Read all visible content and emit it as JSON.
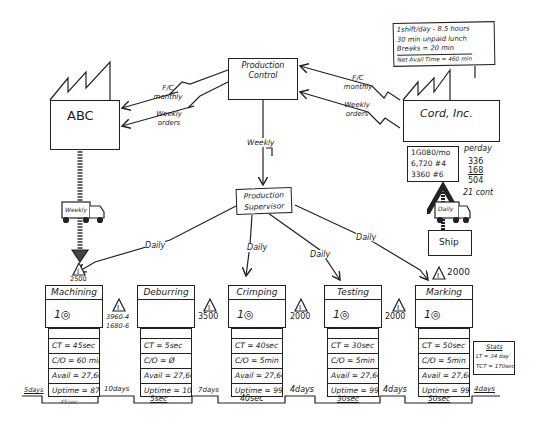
{
  "diagram": {
    "type": "value-stream-map",
    "supplier": {
      "name": "ABC",
      "fc_label": "F/C monthly",
      "orders_label": "Weekly orders",
      "delivery_truck": "Weekly"
    },
    "customer": {
      "name": "Cord, Inc.",
      "fc_label": "F/C monthly",
      "orders_label": "Weekly orders",
      "delivery_truck": "Daily",
      "shipping_box": "Ship",
      "demand_box": {
        "line1": "1G080/mo",
        "line2": "6,720 #4",
        "line3": "3360 #6"
      },
      "per_day": {
        "label": "perday",
        "v1": "336",
        "v2": "168",
        "total": "504",
        "containers": "21 cont"
      },
      "shift_note": {
        "line1": "1shift/day - 8.5 hours",
        "line2": "30 min unpaid lunch",
        "line3": "Breaks = 20 min",
        "line4": "Net Avail Time = 460 min"
      }
    },
    "control": {
      "production_control": "Production Control",
      "supervisor": "Production Supervisor",
      "weekly_label": "Weekly",
      "daily_label": "Daily"
    },
    "inventory": [
      {
        "id": "before-machining",
        "value": "2500"
      },
      {
        "id": "machining-deburring",
        "line1": "3960-4",
        "line2": "1680-6"
      },
      {
        "id": "deburring-crimping",
        "value": "3500"
      },
      {
        "id": "crimping-testing",
        "value": "2000"
      },
      {
        "id": "testing-marking",
        "value": "2000"
      },
      {
        "id": "after-marking",
        "value": "2000"
      }
    ],
    "processes": [
      {
        "name": "Machining",
        "operators": "1",
        "ct": "CT = 45sec",
        "co": "C/O = 60 min",
        "avail": "Avail = 27,600",
        "uptime": "Uptime = 87%"
      },
      {
        "name": "Deburring",
        "operators": "",
        "ct": "CT = 5sec",
        "co": "C/O = Ø",
        "avail": "Avail = 27,600",
        "uptime": "Uptime = 100%"
      },
      {
        "name": "Crimping",
        "operators": "1",
        "ct": "CT = 40sec",
        "co": "C/O = 5min",
        "avail": "Avail = 27,600",
        "uptime": "Uptime = 99%"
      },
      {
        "name": "Testing",
        "operators": "1",
        "ct": "CT = 30sec",
        "co": "C/O = 5min",
        "avail": "Avail = 27,600",
        "uptime": "Uptime = 99%"
      },
      {
        "name": "Marking",
        "operators": "1",
        "ct": "CT = 50sec",
        "co": "C/O = 5min",
        "avail": "Avail = 27,600",
        "uptime": "Uptime = 99%"
      }
    ],
    "stats_box": {
      "title": "Stats",
      "lt": "LT = 34 day",
      "tct": "TCT = 170sec"
    },
    "timeline": {
      "days": [
        "5days",
        "10days",
        "7days",
        "4days",
        "4days",
        "4days"
      ],
      "process_times": [
        "45sec",
        "5sec",
        "40sec",
        "30sec",
        "50sec"
      ]
    }
  }
}
